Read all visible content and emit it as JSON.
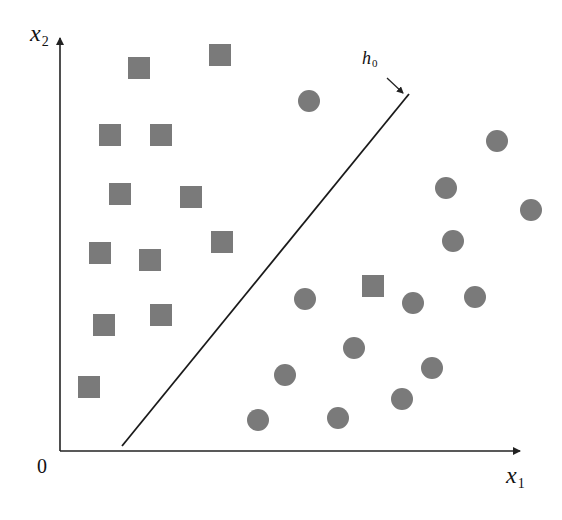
{
  "figure": {
    "title": "",
    "x_axis_label": {
      "main": "x",
      "sub": "1"
    },
    "y_axis_label": {
      "main": "x",
      "sub": "2"
    },
    "origin_label": "0",
    "boundary_label": {
      "main": "h",
      "sub": "0"
    },
    "colors": {
      "marker": "#7a7a7a",
      "axis": "#222222",
      "line": "#1a1a1a"
    }
  },
  "chart_data": {
    "type": "scatter",
    "title": "",
    "xlabel": "x1",
    "ylabel": "x2",
    "grid": false,
    "legend": null,
    "annotations": [
      "h0 (decision boundary line)",
      "0 (origin)"
    ],
    "pixel_space": {
      "origin": [
        60,
        451
      ],
      "x_axis_end": [
        522,
        451
      ],
      "y_axis_end": [
        59,
        36
      ]
    },
    "decision_boundary": {
      "name": "h0",
      "from": [
        122,
        446
      ],
      "to": [
        409,
        94
      ]
    },
    "series": [
      {
        "name": "class_square",
        "marker": "square",
        "points": [
          [
            139,
            68
          ],
          [
            220,
            55
          ],
          [
            110,
            135
          ],
          [
            161,
            135
          ],
          [
            120,
            194
          ],
          [
            191,
            197
          ],
          [
            222,
            242
          ],
          [
            100,
            253
          ],
          [
            150,
            260
          ],
          [
            104,
            325
          ],
          [
            161,
            315
          ],
          [
            89,
            387
          ],
          [
            373,
            286
          ]
        ]
      },
      {
        "name": "class_circle",
        "marker": "circle",
        "points": [
          [
            309,
            101
          ],
          [
            497,
            141
          ],
          [
            446,
            188
          ],
          [
            531,
            210
          ],
          [
            453,
            241
          ],
          [
            305,
            299
          ],
          [
            413,
            303
          ],
          [
            475,
            297
          ],
          [
            354,
            348
          ],
          [
            432,
            368
          ],
          [
            285,
            375
          ],
          [
            402,
            399
          ],
          [
            338,
            418
          ],
          [
            258,
            420
          ]
        ]
      }
    ]
  }
}
